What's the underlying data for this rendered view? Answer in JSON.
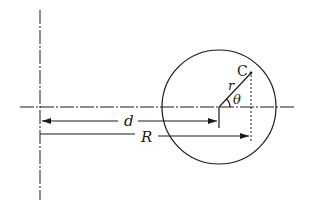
{
  "diagram": {
    "type": "geometry",
    "labels": {
      "point": "C",
      "radius": "r",
      "angle": "θ",
      "distance_center": "d",
      "distance_point": "R"
    },
    "geometry": {
      "vertical_axis_x": 40,
      "horizontal_axis_y": 107,
      "circle_center": [
        219,
        107
      ],
      "circle_radius": 57,
      "point_C": [
        251,
        73
      ]
    }
  }
}
